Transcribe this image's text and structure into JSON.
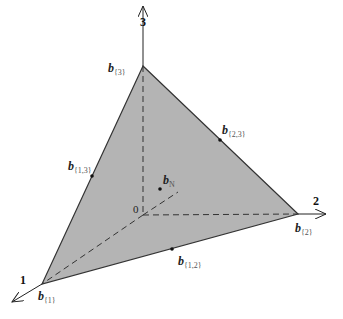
{
  "diagram": {
    "colors": {
      "face": "#b4b4b4",
      "edge": "#333333",
      "axis": "#222222"
    },
    "axes": [
      {
        "id": "1",
        "label": "1"
      },
      {
        "id": "2",
        "label": "2"
      },
      {
        "id": "3",
        "label": "3"
      }
    ],
    "origin_label": "0",
    "points": {
      "b1": {
        "base": "b",
        "sub": "{1}"
      },
      "b2": {
        "base": "b",
        "sub": "{2}"
      },
      "b3": {
        "base": "b",
        "sub": "{3}"
      },
      "b12": {
        "base": "b",
        "sub": "{1,2}"
      },
      "b13": {
        "base": "b",
        "sub": "{1,3}"
      },
      "b23": {
        "base": "b",
        "sub": "{2,3}"
      },
      "bN": {
        "base": "b",
        "sub": "N"
      }
    }
  }
}
